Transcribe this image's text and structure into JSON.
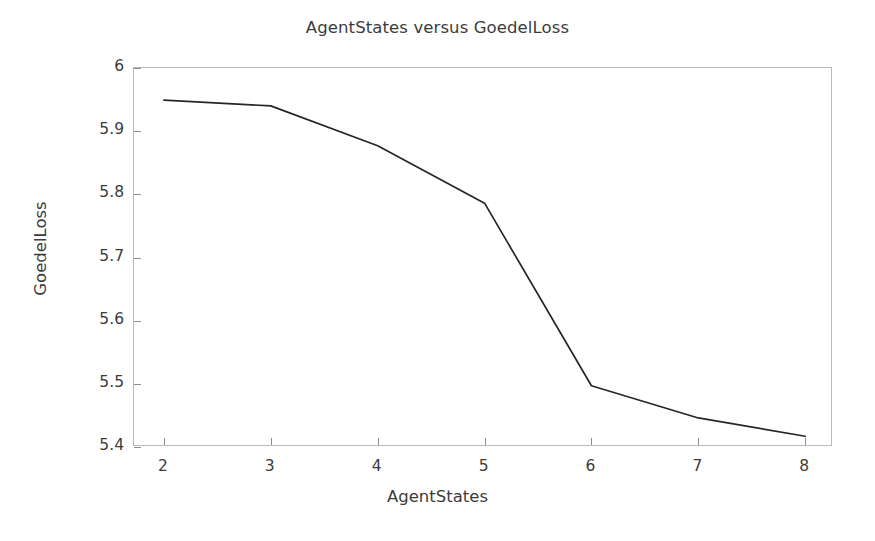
{
  "chart_data": {
    "type": "line",
    "title": "AgentStates versus GoedelLoss",
    "xlabel": "AgentStates",
    "ylabel": "GoedelLoss",
    "x": [
      2,
      3,
      4,
      5,
      6,
      7,
      8
    ],
    "values": [
      5.949,
      5.94,
      5.877,
      5.786,
      5.497,
      5.446,
      5.417
    ],
    "series": [
      {
        "name": "GoedelLoss",
        "values": [
          5.949,
          5.94,
          5.877,
          5.786,
          5.497,
          5.446,
          5.417
        ]
      }
    ],
    "xlim": [
      1.72,
      8.26
    ],
    "ylim": [
      5.4,
      6.0
    ],
    "xticks": [
      2,
      3,
      4,
      5,
      6,
      7,
      8
    ],
    "xtick_labels": [
      "2",
      "3",
      "4",
      "5",
      "6",
      "7",
      "8"
    ],
    "yticks": [
      5.4,
      5.5,
      5.6,
      5.7,
      5.8,
      5.9,
      6.0
    ],
    "ytick_labels": [
      "5.4",
      "5.5",
      "5.6",
      "5.7",
      "5.8",
      "5.9",
      "6"
    ],
    "grid": false,
    "legend": null,
    "line_color": "#262626",
    "line_width": 1.6,
    "frame_color": "#b9b9b9",
    "background": "#ffffff"
  }
}
